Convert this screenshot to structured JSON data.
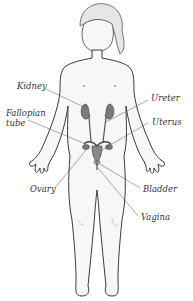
{
  "diagram": {
    "labels": {
      "kidney": "Kidney",
      "fallopian_tube_line1": "Fallopian",
      "fallopian_tube_line2": "tube",
      "ovary": "Ovary",
      "ureter": "Ureter",
      "uterus": "Uterus",
      "bladder": "Bladder",
      "vagina": "Vagina"
    },
    "colors": {
      "outline": "#3a3a3a",
      "skin": "#f7f7f7",
      "organ": "#7a7a7a",
      "leader": "#555555"
    }
  }
}
